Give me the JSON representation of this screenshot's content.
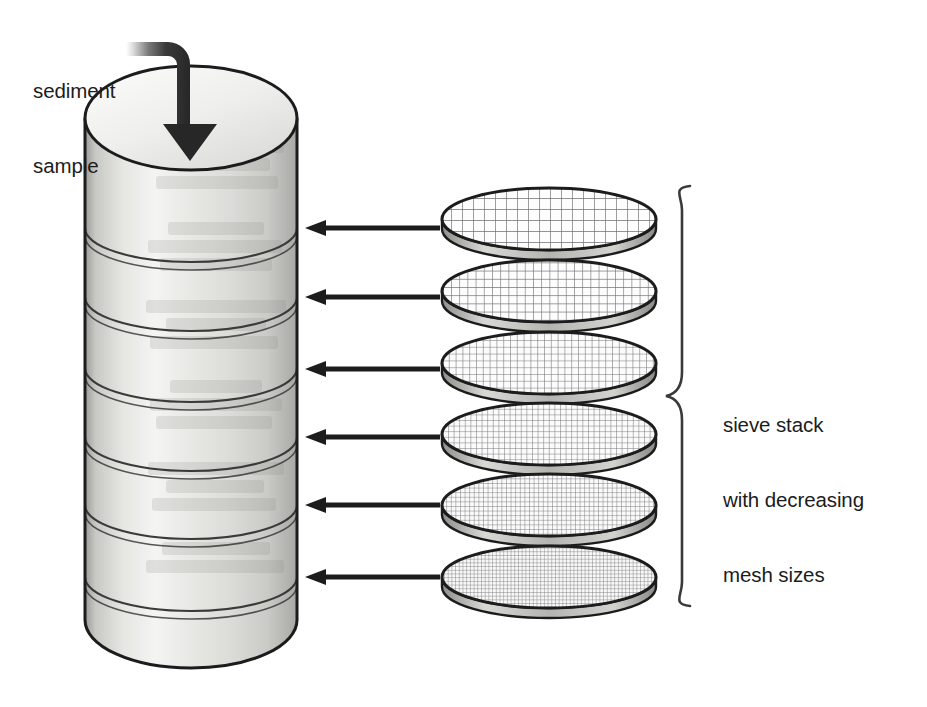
{
  "diagram": {
    "background_color": "#ffffff",
    "ink_color": "#1c1c1c",
    "labels": {
      "sediment_sample": {
        "lines": [
          "sediment",
          "sample"
        ],
        "line1": "sediment",
        "line2": "sample"
      },
      "sieve_stack": {
        "lines": [
          "sieve stack",
          "with decreasing",
          "mesh sizes"
        ],
        "line1": "sieve stack",
        "line2": "with decreasing",
        "line3": "mesh sizes"
      }
    },
    "cylinder_stack": {
      "name": "sieve column",
      "segment_count": 7,
      "joint_count": 6,
      "fill_light": "#f2f2f0",
      "fill_mid": "#dcdcda",
      "fill_dark": "#b9b9b6",
      "outline_color": "#1c1c1c",
      "left_x": 85,
      "right_x": 297,
      "top_y": 118,
      "bottom_y": 668,
      "joint_y": [
        228,
        297,
        368,
        437,
        505,
        577
      ]
    },
    "sieves": [
      {
        "index": 1,
        "label": "sieve-disc-1",
        "center_y": 219,
        "mesh_spacing": 11.0,
        "mesh_color": "#6e6e6e"
      },
      {
        "index": 2,
        "label": "sieve-disc-2",
        "center_y": 291,
        "mesh_spacing": 8.2,
        "mesh_color": "#6e6e6e"
      },
      {
        "index": 3,
        "label": "sieve-disc-3",
        "center_y": 363,
        "mesh_spacing": 6.8,
        "mesh_color": "#6e6e6e"
      },
      {
        "index": 4,
        "label": "sieve-disc-4",
        "center_y": 434,
        "mesh_spacing": 5.6,
        "mesh_color": "#6e6e6e"
      },
      {
        "index": 5,
        "label": "sieve-disc-5",
        "center_y": 505,
        "mesh_spacing": 4.6,
        "mesh_color": "#6e6e6e"
      },
      {
        "index": 6,
        "label": "sieve-disc-6",
        "center_y": 577,
        "mesh_spacing": 3.7,
        "mesh_color": "#6e6e6e"
      }
    ],
    "pointer_arrows": {
      "count": 6,
      "direction": "left",
      "color": "#1c1c1c",
      "tail_x": 440,
      "head_x": 305,
      "y": [
        228,
        297,
        369,
        437,
        505,
        577
      ]
    },
    "feed_arrow": {
      "name": "sediment feed arrow",
      "direction": "down-into-column",
      "gradient_from": "#ffffff",
      "gradient_to": "#2a2a2a",
      "start_x": 126,
      "start_y": 57,
      "tip_x": 190,
      "tip_y": 161
    },
    "brace": {
      "name": "sieve stack brace",
      "orientation": "left-facing-curly",
      "top_y": 186,
      "bottom_y": 606,
      "x": 682,
      "color": "#3a3a3a"
    }
  }
}
